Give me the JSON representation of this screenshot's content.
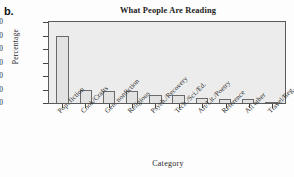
{
  "panel": {
    "letter": "b."
  },
  "chart_data": {
    "type": "bar",
    "title": "What People Are Reading",
    "xlabel": "Category",
    "ylabel": "Percentage",
    "ylim": [
      0,
      60
    ],
    "yticks": [
      0,
      10,
      20,
      30,
      40,
      50,
      60
    ],
    "ytick_labels": [
      "0",
      "10",
      "20",
      "30",
      "40",
      "50",
      "60"
    ],
    "grid": false,
    "legend": "none",
    "categories": [
      "Pop. fiction",
      "Cook/Crafts",
      "Gen. nonfiction",
      "Religious",
      "Psych./Recovery",
      "Tech./Sci./Ed.",
      "Art/Lit./Poetry",
      "Reference",
      "All other",
      "Travel/Reg."
    ],
    "values": [
      50,
      10,
      9,
      9,
      6,
      6,
      4,
      3,
      3,
      1
    ],
    "bar_fill": "#e2e2e2",
    "bar_edge": "#6a6a6a",
    "plot_background": "#ececec",
    "frame_color": "#5a5a5a"
  }
}
